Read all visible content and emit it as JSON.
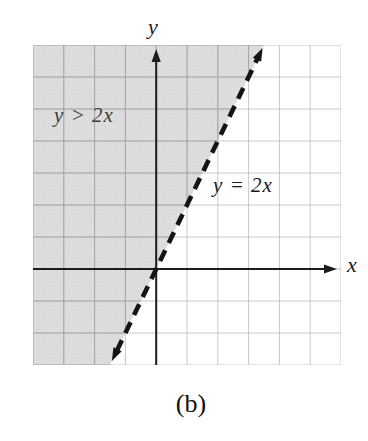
{
  "figure": {
    "axis_label_x": "x",
    "axis_label_y": "y",
    "region_label": "y > 2x",
    "line_label": "y = 2x",
    "caption": "(b)"
  },
  "colors": {
    "background": "#ffffff",
    "shading_base": "#e0e0e0",
    "shading_dots": "#c9c9c9",
    "grid_light": "#c8c8c8",
    "grid_dark": "#a6a6a6",
    "axis": "#1c1c1c",
    "boundary_line": "#141414",
    "text": "#1a1a1a"
  },
  "chart_data": {
    "type": "line",
    "title": "",
    "xlabel": "x",
    "ylabel": "y",
    "xlim": [
      -4,
      6
    ],
    "ylim": [
      -3,
      7
    ],
    "grid": true,
    "grid_spacing": 1,
    "series": [
      {
        "name": "y = 2x",
        "equation": "y = 2x",
        "slope": 2,
        "intercept": 0,
        "style": "dashed",
        "arrows": "both",
        "points": [
          [
            -1.5,
            -3
          ],
          [
            0,
            0
          ],
          [
            3.5,
            7
          ]
        ]
      }
    ],
    "region": {
      "inequality": "y > 2x",
      "shaded_side": "above-left of boundary line",
      "boundary_included": false
    },
    "legend_position": "none",
    "caption": "(b)"
  }
}
